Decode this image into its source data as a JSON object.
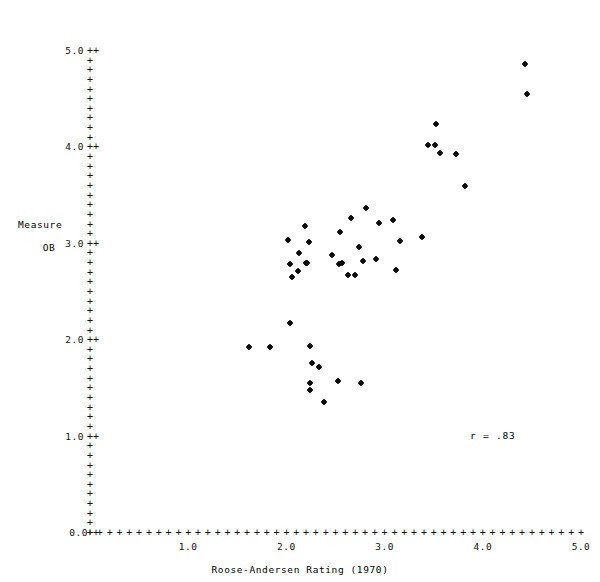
{
  "chart_data": {
    "type": "scatter",
    "title": "",
    "xlabel": "Roose-Andersen Rating (1970)",
    "ylabel": "Measure",
    "ylabel_line2": "OB",
    "xlim": [
      0.0,
      5.0
    ],
    "ylim": [
      0.0,
      5.0
    ],
    "xticks": [
      "0.0",
      "1.0",
      "2.0",
      "3.0",
      "4.0",
      "5.0"
    ],
    "xtick_values": [
      0.0,
      1.0,
      2.0,
      3.0,
      4.0,
      5.0
    ],
    "yticks": [
      "0.0",
      "1.0",
      "2.0",
      "3.0",
      "4.0",
      "5.0"
    ],
    "ytick_values": [
      0.0,
      1.0,
      2.0,
      3.0,
      4.0,
      5.0
    ],
    "grid": false,
    "legend": false,
    "axis_style": "plus-character-ascii-axes",
    "marker": "*",
    "annotations": [
      {
        "text": "r = .83",
        "x": 3.9,
        "y": 1.05
      }
    ],
    "points": [
      {
        "x": 1.62,
        "y": 1.93
      },
      {
        "x": 1.83,
        "y": 1.93
      },
      {
        "x": 2.04,
        "y": 2.18
      },
      {
        "x": 2.06,
        "y": 2.66
      },
      {
        "x": 2.04,
        "y": 2.79
      },
      {
        "x": 2.12,
        "y": 2.72
      },
      {
        "x": 2.2,
        "y": 2.8
      },
      {
        "x": 2.21,
        "y": 2.8
      },
      {
        "x": 2.13,
        "y": 2.9
      },
      {
        "x": 2.23,
        "y": 3.02
      },
      {
        "x": 2.02,
        "y": 3.04
      },
      {
        "x": 2.19,
        "y": 3.18
      },
      {
        "x": 2.24,
        "y": 1.94
      },
      {
        "x": 2.26,
        "y": 1.76
      },
      {
        "x": 2.24,
        "y": 1.56
      },
      {
        "x": 2.24,
        "y": 1.48
      },
      {
        "x": 2.38,
        "y": 1.36
      },
      {
        "x": 2.33,
        "y": 1.72
      },
      {
        "x": 2.46,
        "y": 2.88
      },
      {
        "x": 2.55,
        "y": 3.12
      },
      {
        "x": 2.54,
        "y": 2.79
      },
      {
        "x": 2.57,
        "y": 2.8
      },
      {
        "x": 2.63,
        "y": 2.68
      },
      {
        "x": 2.7,
        "y": 2.68
      },
      {
        "x": 2.53,
        "y": 1.58
      },
      {
        "x": 2.66,
        "y": 3.27
      },
      {
        "x": 2.74,
        "y": 2.97
      },
      {
        "x": 2.81,
        "y": 3.37
      },
      {
        "x": 2.78,
        "y": 2.82
      },
      {
        "x": 2.76,
        "y": 1.56
      },
      {
        "x": 2.94,
        "y": 3.22
      },
      {
        "x": 2.91,
        "y": 2.84
      },
      {
        "x": 3.09,
        "y": 3.25
      },
      {
        "x": 3.16,
        "y": 3.03
      },
      {
        "x": 3.12,
        "y": 2.73
      },
      {
        "x": 3.38,
        "y": 3.07
      },
      {
        "x": 3.44,
        "y": 4.02
      },
      {
        "x": 3.51,
        "y": 4.02
      },
      {
        "x": 3.52,
        "y": 4.24
      },
      {
        "x": 3.56,
        "y": 3.94
      },
      {
        "x": 3.73,
        "y": 3.93
      },
      {
        "x": 3.82,
        "y": 3.6
      },
      {
        "x": 4.43,
        "y": 4.87
      },
      {
        "x": 4.45,
        "y": 4.55
      }
    ]
  }
}
